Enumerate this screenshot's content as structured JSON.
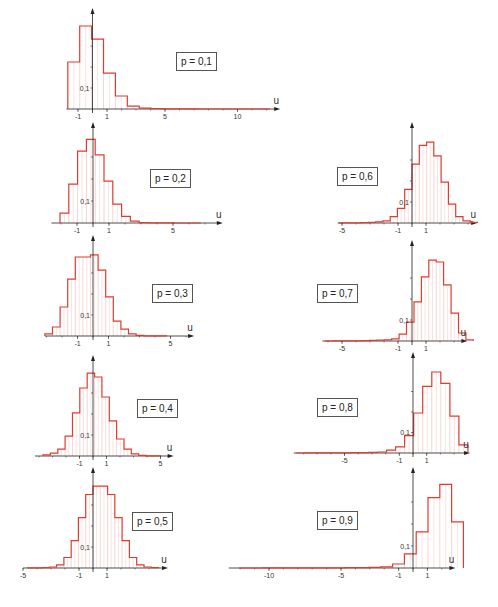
{
  "chart_data": [
    {
      "type": "bar",
      "label": "p = 0,1",
      "origin": [
        92.5,
        109
      ],
      "px_per_unit": 14.5,
      "px_per_0_1": 21,
      "x_range": [
        -1.8,
        12.6
      ],
      "bin_start": -1.7,
      "bin_width": 0.82,
      "values": [
        0.224,
        0.395,
        0.333,
        0.171,
        0.062,
        0.014,
        0.004,
        0.002,
        0.001,
        0.0005,
        0.0003,
        0.0002,
        0.0001,
        0.0001,
        0.0001,
        0.0001,
        0.0001
      ],
      "xticks": [
        -1,
        1,
        5,
        10
      ],
      "xtick_labels": [
        "-1",
        "1",
        "5",
        "10"
      ],
      "ytick_label": "0,1",
      "xlabel": "u",
      "box": [
        176,
        52
      ]
    },
    {
      "type": "bar",
      "label": "p = 0,2",
      "origin": [
        93,
        223
      ],
      "px_per_unit": 16,
      "px_per_0_1": 22,
      "x_range": [
        -2.6,
        7.8
      ],
      "bin_start": -2.06,
      "bin_width": 0.55,
      "values": [
        0.045,
        0.177,
        0.327,
        0.38,
        0.31,
        0.19,
        0.086,
        0.03,
        0.008,
        0.002,
        0.001,
        0.0005,
        0.0003,
        0.0002,
        0.0001,
        0.0001
      ],
      "xticks": [
        -1,
        1,
        5
      ],
      "xtick_labels": [
        "-1",
        "1",
        "5"
      ],
      "ytick_label": "0,1",
      "xlabel": "u",
      "box": [
        150,
        169
      ]
    },
    {
      "type": "bar",
      "label": "p = 0,3",
      "origin": [
        93,
        336
      ],
      "px_per_unit": 15.5,
      "px_per_0_1": 21,
      "x_range": [
        -3.1,
        6.2
      ],
      "bin_start": -3.1,
      "bin_width": 0.49,
      "values": [
        0.01,
        0.043,
        0.138,
        0.271,
        0.376,
        0.376,
        0.386,
        0.314,
        0.186,
        0.071,
        0.033,
        0.01,
        0.003,
        0.001,
        0.0005,
        0.0003
      ],
      "xticks": [
        -1,
        1,
        5
      ],
      "xtick_labels": [
        "-1",
        "1",
        "5"
      ],
      "ytick_label": "0,1",
      "xlabel": "u",
      "box": [
        152,
        284
      ]
    },
    {
      "type": "bar",
      "label": "p = 0,4",
      "origin": [
        93,
        456
      ],
      "px_per_unit": 13.5,
      "px_per_0_1": 21,
      "x_range": [
        -4.3,
        5.6
      ],
      "bin_start": -3.7,
      "bin_width": 0.545,
      "values": [
        0.005,
        0.014,
        0.033,
        0.095,
        0.205,
        0.324,
        0.395,
        0.376,
        0.281,
        0.167,
        0.081,
        0.033,
        0.01,
        0.003,
        0.001,
        0.0005
      ],
      "xticks": [
        -1,
        1,
        5
      ],
      "xtick_labels": [
        "-1",
        "1",
        "5"
      ],
      "ytick_label": "0,1",
      "xlabel": "u",
      "box": [
        137,
        399
      ]
    },
    {
      "type": "bar",
      "label": "p = 0,5",
      "origin": [
        93,
        568
      ],
      "px_per_unit": 14,
      "px_per_0_1": 21,
      "x_range": [
        -5.0,
        5.0
      ],
      "bin_start": -4.68,
      "bin_width": 0.52,
      "values": [
        0.0005,
        0.001,
        0.002,
        0.005,
        0.015,
        0.05,
        0.13,
        0.24,
        0.35,
        0.39,
        0.39,
        0.35,
        0.24,
        0.13,
        0.05,
        0.015,
        0.005,
        0.002
      ],
      "xticks": [
        -5,
        -1,
        1
      ],
      "xtick_labels": [
        "-5",
        "-1",
        "1"
      ],
      "ytick_label": "0,1",
      "xlabel": "u",
      "box": [
        132,
        512
      ]
    },
    {
      "type": "bar",
      "label": "p = 0,6",
      "origin": [
        412,
        223
      ],
      "px_per_unit": 14,
      "px_per_0_1": 21,
      "x_range": [
        -5.3,
        4.3
      ],
      "bin_start": -5.2,
      "bin_width": 0.52,
      "values": [
        0.0003,
        0.0005,
        0.001,
        0.002,
        0.003,
        0.005,
        0.01,
        0.03,
        0.07,
        0.16,
        0.28,
        0.37,
        0.385,
        0.32,
        0.195,
        0.09,
        0.03,
        0.01,
        0.003
      ],
      "xticks": [
        -5,
        -1,
        1
      ],
      "xtick_labels": [
        "-5",
        "-1",
        "1"
      ],
      "ytick_label": "0,1",
      "xlabel": "u",
      "box": [
        337,
        167
      ]
    },
    {
      "type": "bar",
      "label": "p = 0,7",
      "origin": [
        412,
        341
      ],
      "px_per_unit": 14,
      "px_per_0_1": 21,
      "x_range": [
        -6.4,
        3.6
      ],
      "bin_start": -6.22,
      "bin_width": 0.53,
      "values": [
        0.0002,
        0.0003,
        0.0005,
        0.0008,
        0.001,
        0.002,
        0.003,
        0.004,
        0.005,
        0.01,
        0.033,
        0.09,
        0.186,
        0.305,
        0.385,
        0.376,
        0.267,
        0.133,
        0.038,
        0.005
      ],
      "xticks": [
        -5,
        -1,
        1
      ],
      "xtick_labels": [
        "-5",
        "-1",
        "1"
      ],
      "ytick_label": "0,1",
      "xlabel": "u",
      "box": [
        317,
        284
      ]
    },
    {
      "type": "bar",
      "label": "p = 0,8",
      "origin": [
        413,
        453
      ],
      "px_per_unit": 13.7,
      "px_per_0_1": 20.5,
      "x_range": [
        -8.7,
        3.8
      ],
      "bin_start": -8.53,
      "bin_width": 0.66,
      "values": [
        0.0002,
        0.0003,
        0.0004,
        0.0005,
        0.0007,
        0.001,
        0.0015,
        0.002,
        0.003,
        0.005,
        0.014,
        0.03,
        0.085,
        0.195,
        0.325,
        0.395,
        0.34,
        0.18,
        0.04
      ],
      "xticks": [
        -5,
        -1,
        1
      ],
      "xtick_labels": [
        "-5",
        "-1",
        "1"
      ],
      "ytick_label": "0,1",
      "xlabel": "u",
      "box": [
        317,
        398
      ]
    },
    {
      "type": "bar",
      "label": "p = 0,9",
      "origin": [
        413,
        568
      ],
      "px_per_unit": 14.4,
      "px_per_0_1": 22,
      "x_range": [
        -12.8,
        2.6
      ],
      "bin_start": -12.08,
      "bin_width": 0.82,
      "values": [
        0.0002,
        0.0002,
        0.0003,
        0.0003,
        0.0004,
        0.0005,
        0.0006,
        0.0008,
        0.001,
        0.0015,
        0.002,
        0.003,
        0.005,
        0.018,
        0.064,
        0.164,
        0.32,
        0.38,
        0.21
      ],
      "xticks": [
        -10,
        -5,
        -1,
        1
      ],
      "xtick_labels": [
        "-10",
        "-5",
        "-1",
        "1"
      ],
      "ytick_label": "0,1",
      "xlabel": "u",
      "box": [
        317,
        511
      ]
    }
  ],
  "colors": {
    "bar_outline": "#e23b2e",
    "bar_grid": "#f2b8b2",
    "axis": "#222222",
    "label_border": "#555555"
  }
}
